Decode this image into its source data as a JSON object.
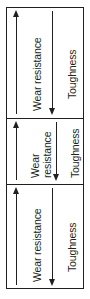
{
  "figure": {
    "name": "wear-resistance-toughness-tradeoff",
    "panel_count": 3,
    "line_color": "#231f20",
    "background_color": "#ffffff",
    "labels": {
      "wear_resistance": "Wear resistance",
      "toughness": "Toughness",
      "wear_resistance_line1": "Wear",
      "wear_resistance_line2": "resistance"
    },
    "panels": [
      {
        "id": "panel-top",
        "arrows": [
          {
            "id": "wear-arrow-top",
            "label": "Wear resistance",
            "direction": "up"
          },
          {
            "id": "toughness-arrow-top",
            "label": "Toughness",
            "direction": "down"
          }
        ]
      },
      {
        "id": "panel-middle",
        "arrows": [
          {
            "id": "wear-arrow-middle",
            "label": "Wear resistance",
            "direction": "up"
          },
          {
            "id": "toughness-arrow-middle",
            "label": "Toughness",
            "direction": "down"
          }
        ]
      },
      {
        "id": "panel-bottom",
        "arrows": [
          {
            "id": "wear-arrow-bottom",
            "label": "Wear resistance",
            "direction": "up"
          },
          {
            "id": "toughness-arrow-bottom",
            "label": "Toughness",
            "direction": "down"
          }
        ]
      }
    ]
  }
}
